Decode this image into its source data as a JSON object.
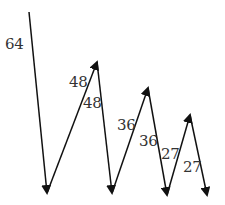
{
  "diagram": {
    "type": "zigzag-arrows",
    "stroke_color": "#111111",
    "label_color": "#333333",
    "background": "#ffffff",
    "arrows": [
      {
        "from": [
          29,
          12
        ],
        "to": [
          47,
          193
        ],
        "label": "64",
        "label_pos": [
          5,
          37
        ]
      },
      {
        "from": [
          47,
          193
        ],
        "to": [
          97,
          62
        ],
        "label": "48",
        "label_pos": [
          69,
          75
        ]
      },
      {
        "from": [
          97,
          62
        ],
        "to": [
          112,
          193
        ],
        "label": "48",
        "label_pos": [
          83,
          96
        ]
      },
      {
        "from": [
          112,
          193
        ],
        "to": [
          148,
          88
        ],
        "label": "36",
        "label_pos": [
          117,
          118
        ]
      },
      {
        "from": [
          148,
          88
        ],
        "to": [
          167,
          195
        ],
        "label": "36",
        "label_pos": [
          139,
          134
        ]
      },
      {
        "from": [
          167,
          195
        ],
        "to": [
          190,
          115
        ],
        "label": "27",
        "label_pos": [
          161,
          147
        ]
      },
      {
        "from": [
          190,
          115
        ],
        "to": [
          207,
          195
        ],
        "label": "27",
        "label_pos": [
          183,
          160
        ]
      }
    ]
  },
  "labels": {
    "a1": "64",
    "a2": "48",
    "a3": "48",
    "a4": "36",
    "a5": "36",
    "a6": "27",
    "a7": "27"
  }
}
